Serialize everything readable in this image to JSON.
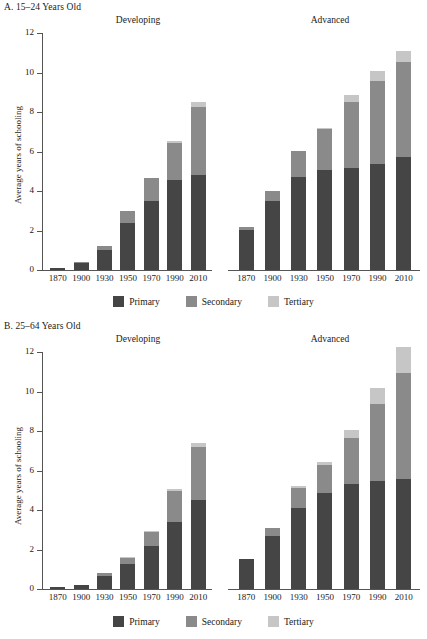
{
  "figure": {
    "ylabel": "Average years of schooling",
    "legend": [
      {
        "label": "Primary",
        "color": "#454545"
      },
      {
        "label": "Secondary",
        "color": "#8a8a8a"
      },
      {
        "label": "Tertiary",
        "color": "#c6c6c6"
      }
    ],
    "group_labels": {
      "developing": "Developing",
      "advanced": "Advanced"
    },
    "yticks": [
      "12",
      "10",
      "8",
      "6",
      "4",
      "2",
      "0"
    ],
    "xticks": [
      "1870",
      "1900",
      "1930",
      "1950",
      "1970",
      "1990",
      "2010"
    ]
  },
  "panels": {
    "a": {
      "title": "A. 15–24 Years Old"
    },
    "b": {
      "title": "B. 25–64 Years Old"
    }
  },
  "chart_data": [
    {
      "type": "bar",
      "id": "panel-a-developing",
      "title": "A. 15–24 Years Old — Developing",
      "xlabel": "",
      "ylabel": "Average years of schooling",
      "ylim": [
        0,
        12
      ],
      "yticks": [
        0,
        2,
        4,
        6,
        8,
        10,
        12
      ],
      "grid": false,
      "stacked": true,
      "legend_position": "bottom",
      "categories": [
        "1870",
        "1900",
        "1930",
        "1950",
        "1970",
        "1990",
        "2010"
      ],
      "series": [
        {
          "name": "Primary",
          "values": [
            0.1,
            0.35,
            1.0,
            2.4,
            3.5,
            4.55,
            4.8
          ]
        },
        {
          "name": "Secondary",
          "values": [
            0.0,
            0.05,
            0.2,
            0.6,
            1.15,
            1.9,
            3.45
          ]
        },
        {
          "name": "Tertiary",
          "values": [
            0.0,
            0.0,
            0.0,
            0.0,
            0.0,
            0.1,
            0.25
          ]
        }
      ],
      "totals": [
        0.1,
        0.4,
        1.2,
        3.0,
        4.65,
        6.55,
        8.5
      ]
    },
    {
      "type": "bar",
      "id": "panel-a-advanced",
      "title": "A. 15–24 Years Old — Advanced",
      "xlabel": "",
      "ylabel": "Average years of schooling",
      "ylim": [
        0,
        12
      ],
      "yticks": [
        0,
        2,
        4,
        6,
        8,
        10,
        12
      ],
      "grid": false,
      "stacked": true,
      "legend_position": "bottom",
      "categories": [
        "1870",
        "1900",
        "1930",
        "1950",
        "1970",
        "1990",
        "2010"
      ],
      "series": [
        {
          "name": "Primary",
          "values": [
            2.05,
            3.5,
            4.7,
            5.05,
            5.15,
            5.35,
            5.7
          ]
        },
        {
          "name": "Secondary",
          "values": [
            0.15,
            0.5,
            1.35,
            2.1,
            3.35,
            4.2,
            4.85
          ]
        },
        {
          "name": "Tertiary",
          "values": [
            0.0,
            0.0,
            0.0,
            0.05,
            0.35,
            0.55,
            0.55
          ]
        }
      ],
      "totals": [
        2.2,
        4.0,
        6.05,
        7.2,
        8.85,
        10.1,
        11.1
      ]
    },
    {
      "type": "bar",
      "id": "panel-b-developing",
      "title": "B. 25–64 Years Old — Developing",
      "xlabel": "",
      "ylabel": "Average years of schooling",
      "ylim": [
        0,
        12
      ],
      "yticks": [
        0,
        2,
        4,
        6,
        8,
        10,
        12
      ],
      "grid": false,
      "stacked": true,
      "legend_position": "bottom",
      "categories": [
        "1870",
        "1900",
        "1930",
        "1950",
        "1970",
        "1990",
        "2010"
      ],
      "series": [
        {
          "name": "Primary",
          "values": [
            0.08,
            0.2,
            0.65,
            1.25,
            2.2,
            3.4,
            4.5
          ]
        },
        {
          "name": "Secondary",
          "values": [
            0.0,
            0.0,
            0.15,
            0.3,
            0.7,
            1.55,
            2.7
          ]
        },
        {
          "name": "Tertiary",
          "values": [
            0.0,
            0.0,
            0.0,
            0.05,
            0.05,
            0.1,
            0.2
          ]
        }
      ],
      "totals": [
        0.08,
        0.2,
        0.8,
        1.6,
        2.95,
        5.05,
        7.4
      ]
    },
    {
      "type": "bar",
      "id": "panel-b-advanced",
      "title": "B. 25–64 Years Old — Advanced",
      "xlabel": "",
      "ylabel": "Average years of schooling",
      "ylim": [
        0,
        12
      ],
      "yticks": [
        0,
        2,
        4,
        6,
        8,
        10,
        12
      ],
      "grid": false,
      "stacked": true,
      "legend_position": "bottom",
      "categories": [
        "1870",
        "1900",
        "1930",
        "1950",
        "1970",
        "1990",
        "2010"
      ],
      "series": [
        {
          "name": "Primary",
          "values": [
            1.5,
            2.7,
            4.1,
            4.85,
            5.3,
            5.45,
            5.55
          ]
        },
        {
          "name": "Secondary",
          "values": [
            0.0,
            0.4,
            1.0,
            1.45,
            2.35,
            3.9,
            5.4
          ]
        },
        {
          "name": "Tertiary",
          "values": [
            0.0,
            0.0,
            0.1,
            0.15,
            0.4,
            0.85,
            1.3
          ]
        }
      ],
      "totals": [
        1.5,
        3.1,
        5.2,
        6.45,
        8.05,
        10.2,
        12.25
      ]
    }
  ]
}
